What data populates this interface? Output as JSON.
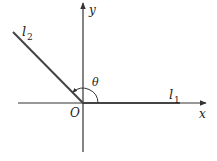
{
  "diagram": {
    "labels": {
      "y_axis": "y",
      "x_axis": "x",
      "origin": "O",
      "angle": "θ",
      "line1_base": "l",
      "line1_sub": "1",
      "line2_base": "l",
      "line2_sub": "2"
    },
    "colors": {
      "stroke": "#333333",
      "line_l1": "#444444",
      "text": "#222222"
    }
  }
}
